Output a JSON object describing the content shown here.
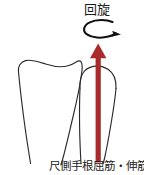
{
  "figure": {
    "title_label": "回旋",
    "muscle_label": "尺側手根屈筋・伸筋",
    "background_color": "#ffffff",
    "bone_stroke_color": "#2b2b2b",
    "arrow_color": "#a82a2a",
    "curved_arrow_color": "#111111",
    "elements": {
      "rotation_arrow_name": "回旋",
      "force_arrow_name": "尺側手根屈筋・伸筋",
      "left_bone_name": "橈骨",
      "right_bone_name": "尺骨"
    }
  }
}
